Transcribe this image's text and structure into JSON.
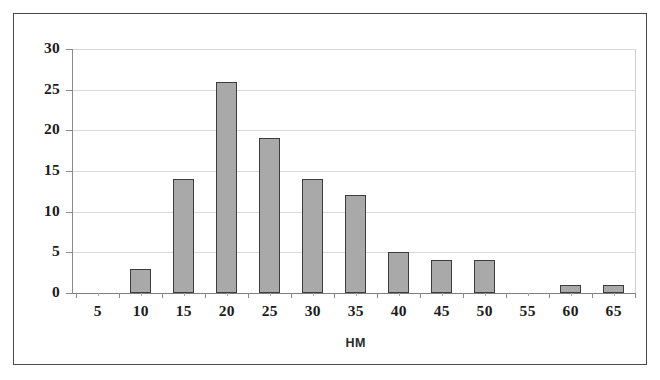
{
  "chart_data": {
    "type": "bar",
    "title": "",
    "subtitle": "",
    "xlabel": "HM",
    "ylabel": "",
    "categories": [
      "5",
      "10",
      "15",
      "20",
      "25",
      "30",
      "35",
      "40",
      "45",
      "50",
      "55",
      "60",
      "65"
    ],
    "values": [
      0,
      3,
      14,
      26,
      19,
      14,
      12,
      5,
      4,
      4,
      0,
      1,
      1
    ],
    "x_tick_labels": [
      "5",
      "10",
      "15",
      "20",
      "25",
      "30",
      "35",
      "40",
      "45",
      "50",
      "55",
      "60",
      "65"
    ],
    "y_tick_labels": [
      "0",
      "5",
      "10",
      "15",
      "20",
      "25",
      "30"
    ],
    "y_tick_values": [
      0,
      5,
      10,
      15,
      20,
      25,
      30
    ],
    "ylim": [
      0,
      30
    ],
    "grid": true,
    "grid_axis": "y",
    "legend": false,
    "legend_position": "none",
    "bar_fill_color": "#a9a9a9",
    "bar_border_color": "#3d3d3d",
    "gridline_color": "#d9d9d9",
    "axis_color": "#8a8a8a",
    "frame_color": "#4a4a4a",
    "background_color": "#ffffff"
  }
}
